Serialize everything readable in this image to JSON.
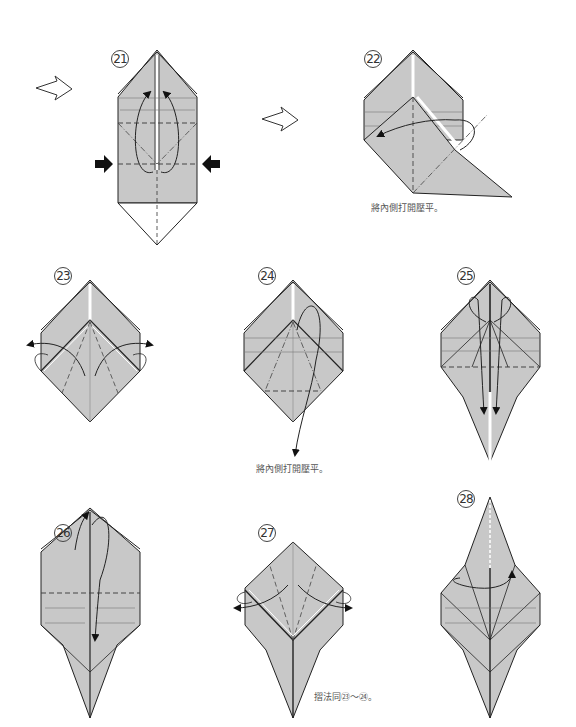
{
  "diagram": {
    "type": "origami-instructions",
    "colors": {
      "paper_fill": "#c8c8c8",
      "line": "#222222",
      "background": "#ffffff"
    },
    "steps": [
      {
        "number": "21",
        "label": "㉑",
        "caption": ""
      },
      {
        "number": "22",
        "label": "㉒",
        "caption": "將內側打開壓平。"
      },
      {
        "number": "23",
        "label": "㉓",
        "caption": ""
      },
      {
        "number": "24",
        "label": "㉔",
        "caption": "將內側打開壓平。"
      },
      {
        "number": "25",
        "label": "㉕",
        "caption": ""
      },
      {
        "number": "26",
        "label": "㉖",
        "caption": ""
      },
      {
        "number": "27",
        "label": "㉗",
        "caption": "摺法同㉓～㉔。"
      },
      {
        "number": "28",
        "label": "㉘",
        "caption": ""
      }
    ],
    "transition_arrows": [
      "hollow-arrow-right",
      "hollow-arrow-right"
    ]
  }
}
